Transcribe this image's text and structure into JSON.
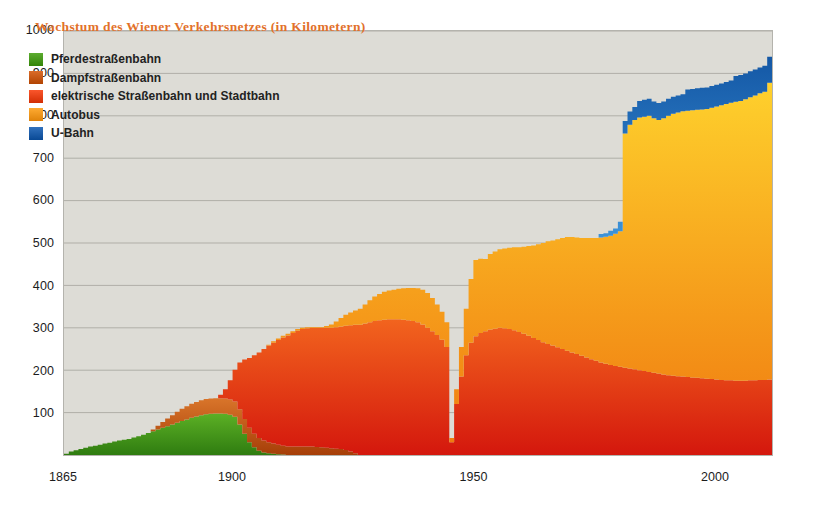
{
  "chart_data": {
    "type": "area",
    "stacked": true,
    "title": "Wachstum des Wiener Verkehrsnetzes (in Kilometern)",
    "xlabel": "",
    "ylabel": "",
    "xlim": [
      1865,
      2012
    ],
    "ylim": [
      0,
      1000
    ],
    "yticks": [
      100,
      200,
      300,
      400,
      500,
      600,
      700,
      800,
      900,
      1000
    ],
    "xticks": [
      1865,
      1900,
      1950,
      2000
    ],
    "grid": "horizontal",
    "legend_position": "top-left inside plot",
    "background_color": "#dddcd6",
    "gridline_color": "#b0afa8",
    "title_color": "#e2712b",
    "series": [
      {
        "name": "Pferdestraßenbahn",
        "color": "#4a9a1e",
        "color_top": "#5cb025",
        "color_bottom": "#2f7c10",
        "x": [
          1865,
          1866,
          1867,
          1868,
          1869,
          1870,
          1871,
          1872,
          1873,
          1874,
          1875,
          1876,
          1877,
          1878,
          1879,
          1880,
          1881,
          1882,
          1883,
          1884,
          1885,
          1886,
          1887,
          1888,
          1889,
          1890,
          1891,
          1892,
          1893,
          1894,
          1895,
          1896,
          1897,
          1898,
          1899,
          1900,
          1901,
          1902,
          1903,
          1904,
          1905,
          1906,
          1907,
          1908,
          1909,
          1910,
          1911,
          1912,
          1913,
          1914,
          1915
        ],
        "values": [
          3,
          8,
          11,
          14,
          17,
          20,
          22,
          24,
          27,
          29,
          32,
          34,
          36,
          38,
          41,
          44,
          48,
          52,
          56,
          60,
          64,
          68,
          72,
          76,
          80,
          84,
          88,
          91,
          94,
          96,
          97,
          98,
          98,
          97,
          95,
          90,
          72,
          50,
          30,
          18,
          10,
          6,
          4,
          3,
          2,
          1,
          0,
          0,
          0,
          0,
          0
        ]
      },
      {
        "name": "Dampfstraßenbahn",
        "color": "#c85a18",
        "color_top": "#d9752a",
        "color_bottom": "#a63e08",
        "x": [
          1883,
          1884,
          1885,
          1886,
          1887,
          1888,
          1889,
          1890,
          1891,
          1892,
          1893,
          1894,
          1895,
          1896,
          1897,
          1898,
          1899,
          1900,
          1901,
          1902,
          1903,
          1904,
          1905,
          1906,
          1907,
          1908,
          1909,
          1910,
          1911,
          1912,
          1913,
          1914,
          1915,
          1916,
          1917,
          1918,
          1919,
          1920,
          1921,
          1922,
          1923,
          1924,
          1925
        ],
        "values": [
          4,
          9,
          14,
          18,
          22,
          26,
          29,
          31,
          33,
          34,
          35,
          36,
          36,
          36,
          36,
          36,
          36,
          36,
          36,
          35,
          34,
          32,
          30,
          28,
          26,
          24,
          22,
          21,
          20,
          20,
          20,
          20,
          20,
          20,
          19,
          18,
          17,
          16,
          15,
          14,
          12,
          8,
          4
        ]
      },
      {
        "name": "elektrische Straßenbahn und Stadtbahn",
        "color": "#e8441a",
        "color_top": "#f2641e",
        "color_bottom": "#d4170d",
        "x": [
          1897,
          1898,
          1899,
          1900,
          1901,
          1902,
          1903,
          1904,
          1905,
          1906,
          1907,
          1908,
          1909,
          1910,
          1911,
          1912,
          1913,
          1914,
          1915,
          1916,
          1917,
          1918,
          1919,
          1920,
          1921,
          1922,
          1923,
          1924,
          1925,
          1926,
          1927,
          1928,
          1929,
          1930,
          1931,
          1932,
          1933,
          1934,
          1935,
          1936,
          1937,
          1938,
          1939,
          1940,
          1941,
          1942,
          1943,
          1944,
          1945,
          1946,
          1947,
          1948,
          1949,
          1950,
          1951,
          1952,
          1953,
          1954,
          1955,
          1956,
          1957,
          1958,
          1959,
          1960,
          1961,
          1962,
          1963,
          1964,
          1965,
          1966,
          1967,
          1968,
          1969,
          1970,
          1971,
          1972,
          1973,
          1974,
          1975,
          1976,
          1977,
          1978,
          1979,
          1980,
          1981,
          1982,
          1983,
          1984,
          1985,
          1986,
          1987,
          1988,
          1989,
          1990,
          1991,
          1992,
          1993,
          1994,
          1995,
          1996,
          1997,
          1998,
          1999,
          2000,
          2001,
          2002,
          2003,
          2004,
          2005,
          2006,
          2007,
          2008,
          2009,
          2010,
          2011,
          2012
        ],
        "values": [
          8,
          22,
          45,
          75,
          110,
          140,
          165,
          185,
          202,
          216,
          228,
          238,
          247,
          255,
          262,
          268,
          273,
          277,
          279,
          280,
          281,
          282,
          283,
          284,
          286,
          289,
          293,
          298,
          303,
          307,
          310,
          313,
          316,
          318,
          319,
          320,
          320,
          320,
          319,
          318,
          316,
          313,
          308,
          300,
          292,
          283,
          272,
          255,
          30,
          120,
          185,
          235,
          265,
          280,
          288,
          292,
          296,
          298,
          300,
          299,
          297,
          294,
          290,
          286,
          281,
          276,
          271,
          266,
          262,
          258,
          254,
          250,
          246,
          242,
          238,
          234,
          230,
          226,
          222,
          218,
          215,
          212,
          210,
          208,
          206,
          204,
          202,
          200,
          198,
          196,
          194,
          192,
          190,
          188,
          187,
          186,
          185,
          184,
          183,
          182,
          181,
          180,
          179,
          178,
          177,
          176,
          176,
          175,
          175,
          175,
          176,
          176,
          177,
          177,
          178,
          178
        ]
      },
      {
        "name": "Autobus",
        "color": "#f59920",
        "color_top": "#ffd52e",
        "color_bottom": "#f07c10",
        "x": [
          1907,
          1908,
          1909,
          1910,
          1911,
          1912,
          1913,
          1914,
          1915,
          1916,
          1917,
          1918,
          1919,
          1920,
          1921,
          1922,
          1923,
          1924,
          1925,
          1926,
          1927,
          1928,
          1929,
          1930,
          1931,
          1932,
          1933,
          1934,
          1935,
          1936,
          1937,
          1938,
          1939,
          1940,
          1941,
          1942,
          1943,
          1944,
          1945,
          1946,
          1947,
          1948,
          1949,
          1950,
          1951,
          1952,
          1953,
          1954,
          1955,
          1956,
          1957,
          1958,
          1959,
          1960,
          1961,
          1962,
          1963,
          1964,
          1965,
          1966,
          1967,
          1968,
          1969,
          1970,
          1971,
          1972,
          1973,
          1974,
          1975,
          1976,
          1977,
          1978,
          1979,
          1980,
          1981,
          1982,
          1983,
          1984,
          1985,
          1986,
          1987,
          1988,
          1989,
          1990,
          1991,
          1992,
          1993,
          1994,
          1995,
          1996,
          1997,
          1998,
          1999,
          2000,
          2001,
          2002,
          2003,
          2004,
          2005,
          2006,
          2007,
          2008,
          2009,
          2010,
          2011,
          2012
        ],
        "values": [
          2,
          3,
          4,
          4,
          4,
          4,
          4,
          3,
          2,
          2,
          2,
          2,
          4,
          8,
          14,
          20,
          26,
          30,
          34,
          38,
          45,
          52,
          58,
          62,
          66,
          68,
          70,
          72,
          74,
          76,
          78,
          80,
          82,
          82,
          78,
          72,
          66,
          58,
          10,
          35,
          70,
          110,
          150,
          180,
          175,
          170,
          178,
          182,
          185,
          188,
          192,
          196,
          200,
          205,
          212,
          218,
          226,
          234,
          242,
          248,
          255,
          262,
          268,
          272,
          275,
          278,
          282,
          286,
          290,
          295,
          300,
          305,
          312,
          320,
          552,
          575,
          588,
          596,
          600,
          604,
          600,
          598,
          604,
          612,
          618,
          622,
          626,
          628,
          630,
          632,
          634,
          636,
          640,
          644,
          648,
          652,
          655,
          658,
          660,
          664,
          668,
          672,
          676,
          680,
          700,
          745
        ]
      },
      {
        "name": "U-Bahn",
        "color": "#1f5fab",
        "color_top": "#0e4f9e",
        "color_bottom": "#3d93d8",
        "x": [
          1976,
          1977,
          1978,
          1979,
          1980,
          1981,
          1982,
          1983,
          1984,
          1985,
          1986,
          1987,
          1988,
          1989,
          1990,
          1991,
          1992,
          1993,
          1994,
          1995,
          1996,
          1997,
          1998,
          1999,
          2000,
          2001,
          2002,
          2003,
          2004,
          2005,
          2006,
          2007,
          2008,
          2009,
          2010,
          2011,
          2012
        ],
        "values": [
          8,
          8,
          12,
          12,
          22,
          30,
          31,
          31,
          39,
          40,
          40,
          40,
          40,
          40,
          40,
          40,
          40,
          40,
          50,
          50,
          51,
          51,
          51,
          51,
          51,
          51,
          52,
          52,
          61,
          61,
          61,
          61,
          61,
          61,
          61,
          61,
          77
        ]
      }
    ]
  },
  "axis": {
    "y_ticks": [
      {
        "label": "1000",
        "value": 1000
      },
      {
        "label": "900",
        "value": 900
      },
      {
        "label": "800",
        "value": 800
      },
      {
        "label": "700",
        "value": 700
      },
      {
        "label": "600",
        "value": 600
      },
      {
        "label": "500",
        "value": 500
      },
      {
        "label": "400",
        "value": 400
      },
      {
        "label": "300",
        "value": 300
      },
      {
        "label": "200",
        "value": 200
      },
      {
        "label": "100",
        "value": 100
      }
    ],
    "x_ticks": [
      {
        "label": "1865",
        "value": 1865
      },
      {
        "label": "1900",
        "value": 1900
      },
      {
        "label": "1950",
        "value": 1950
      },
      {
        "label": "2000",
        "value": 2000
      }
    ]
  },
  "legend": {
    "items": [
      {
        "label": "Pferdestraßenbahn",
        "color": "#4a9a1e"
      },
      {
        "label": "Dampfstraßenbahn",
        "color": "#c85a18"
      },
      {
        "label": "elektrische Straßenbahn und Stadtbahn",
        "color": "#e8441a"
      },
      {
        "label": "Autobus",
        "color": "#f59920"
      },
      {
        "label": "U-Bahn",
        "color": "#1f5fab"
      }
    ]
  }
}
